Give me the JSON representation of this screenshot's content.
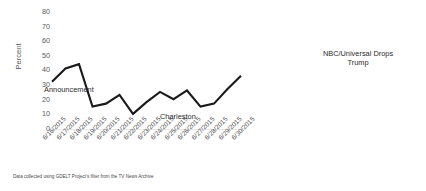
{
  "chart_data": {
    "type": "line",
    "title": "",
    "xlabel": "",
    "ylabel": "Percent",
    "ylim": [
      0,
      80
    ],
    "ytick_step": 10,
    "yticks": [
      "80",
      "70",
      "60",
      "50",
      "40",
      "30",
      "20",
      "10",
      "0"
    ],
    "grid": false,
    "legend": "none",
    "line_color": "#1a1a1a",
    "axis_color": "#e8e8e8",
    "tick_label_color": "#595959",
    "categories": [
      "6/16/2015",
      "6/17/2015",
      "6/18/2015",
      "6/19/2015",
      "6/20/2015",
      "6/21/2015",
      "6/22/2015",
      "6/23/2015",
      "6/24/2015",
      "6/25/2015",
      "6/26/2015",
      "6/27/2015",
      "6/28/2015",
      "6/29/2015",
      "6/30/2015"
    ],
    "values": [
      32,
      41,
      44,
      15,
      17,
      23,
      10,
      18,
      25,
      20,
      26,
      15,
      17,
      27,
      36
    ],
    "annotations": [
      {
        "text": "Announcement",
        "x": "6/16/2015",
        "value": 32
      },
      {
        "text": "Charleston",
        "x": "6/22/2015",
        "value": 10
      },
      {
        "text": "NBC/Universal Drops Trump",
        "x": "6/29/2015",
        "value": 27
      }
    ]
  },
  "footnote": "Data collected using GDELT Project's filter from the TV News Archive"
}
